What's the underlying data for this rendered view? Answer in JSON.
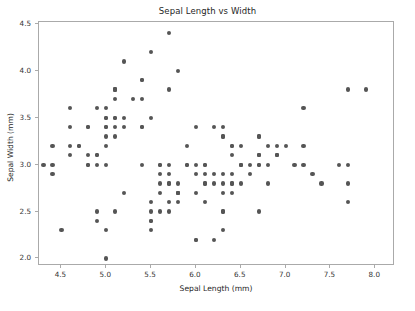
{
  "chart_data": {
    "type": "scatter",
    "title": "Sepal Length vs Width",
    "xlabel": "Sepal Length (mm)",
    "ylabel": "Sepal Width (mm)",
    "xlim": [
      4.25,
      8.22
    ],
    "ylim": [
      1.92,
      4.52
    ],
    "xticks": [
      4.5,
      5.0,
      5.5,
      6.0,
      6.5,
      7.0,
      7.5,
      8.0
    ],
    "xtick_labels": [
      "4.5",
      "5.0",
      "5.5",
      "6.0",
      "6.5",
      "7.0",
      "7.5",
      "8.0"
    ],
    "yticks": [
      2.0,
      2.5,
      3.0,
      3.5,
      4.0,
      4.5
    ],
    "ytick_labels": [
      "2.0",
      "2.5",
      "3.0",
      "3.5",
      "4.0",
      "4.5"
    ],
    "grid": false,
    "legend": null,
    "marker_color": "#555555",
    "marker_size_px": 4.2,
    "n_points": 150,
    "x": [
      5.1,
      4.9,
      4.7,
      4.6,
      5.0,
      5.4,
      4.6,
      5.0,
      4.4,
      4.9,
      5.4,
      4.8,
      4.8,
      4.3,
      5.8,
      5.7,
      5.4,
      5.1,
      5.7,
      5.1,
      5.4,
      5.1,
      4.6,
      5.1,
      4.8,
      5.0,
      5.0,
      5.2,
      5.2,
      4.7,
      4.8,
      5.4,
      5.2,
      5.5,
      4.9,
      5.0,
      5.5,
      4.9,
      4.4,
      5.1,
      5.0,
      4.5,
      4.4,
      5.0,
      5.1,
      4.8,
      5.1,
      4.6,
      5.3,
      5.0,
      7.0,
      6.4,
      6.9,
      5.5,
      6.5,
      5.7,
      6.3,
      4.9,
      6.6,
      5.2,
      5.0,
      5.9,
      6.0,
      6.1,
      5.6,
      6.7,
      5.6,
      5.8,
      6.2,
      5.6,
      5.9,
      6.1,
      6.3,
      6.1,
      6.4,
      6.6,
      6.8,
      6.7,
      6.0,
      5.7,
      5.5,
      5.5,
      5.8,
      6.0,
      5.4,
      6.0,
      6.7,
      6.3,
      5.6,
      5.5,
      5.5,
      6.1,
      5.8,
      5.0,
      5.6,
      5.7,
      5.7,
      6.2,
      5.1,
      5.7,
      6.3,
      5.8,
      7.1,
      6.3,
      6.5,
      7.6,
      4.9,
      7.3,
      6.7,
      7.2,
      6.5,
      6.4,
      6.8,
      5.7,
      5.8,
      6.4,
      6.5,
      7.7,
      7.7,
      6.0,
      6.9,
      5.6,
      7.7,
      6.3,
      6.7,
      7.2,
      6.2,
      6.1,
      6.4,
      7.2,
      7.4,
      7.9,
      6.4,
      6.3,
      6.1,
      7.7,
      6.3,
      6.4,
      6.0,
      6.9,
      6.7,
      6.9,
      5.8,
      6.8,
      6.7,
      6.7,
      6.3,
      6.5,
      6.2,
      5.9
    ],
    "y": [
      3.5,
      3.0,
      3.2,
      3.1,
      3.6,
      3.9,
      3.4,
      3.4,
      2.9,
      3.1,
      3.7,
      3.4,
      3.0,
      3.0,
      4.0,
      4.4,
      3.9,
      3.5,
      3.8,
      3.8,
      3.4,
      3.7,
      3.6,
      3.3,
      3.4,
      3.0,
      3.4,
      3.5,
      3.4,
      3.2,
      3.1,
      3.4,
      4.1,
      4.2,
      3.1,
      3.2,
      3.5,
      3.6,
      3.0,
      3.4,
      3.5,
      2.3,
      3.2,
      3.5,
      3.8,
      3.0,
      3.8,
      3.2,
      3.7,
      3.3,
      3.2,
      3.2,
      3.1,
      2.3,
      2.8,
      2.8,
      3.3,
      2.4,
      2.9,
      2.7,
      2.0,
      3.0,
      2.2,
      2.9,
      2.9,
      3.1,
      3.0,
      2.7,
      2.2,
      2.5,
      3.2,
      2.8,
      2.5,
      2.8,
      2.9,
      3.0,
      2.8,
      3.0,
      2.9,
      2.6,
      2.4,
      2.4,
      2.7,
      2.7,
      3.0,
      3.4,
      3.1,
      2.3,
      3.0,
      2.5,
      2.6,
      3.0,
      2.6,
      2.3,
      2.7,
      3.0,
      2.9,
      2.9,
      2.5,
      2.8,
      3.3,
      2.7,
      3.0,
      2.9,
      3.0,
      3.0,
      2.5,
      2.9,
      2.5,
      3.6,
      3.2,
      2.7,
      3.0,
      2.5,
      2.8,
      3.2,
      3.0,
      3.8,
      2.6,
      2.2,
      3.2,
      2.8,
      2.8,
      2.7,
      3.3,
      3.2,
      2.8,
      3.0,
      2.8,
      3.0,
      2.8,
      3.8,
      2.8,
      2.8,
      2.6,
      3.0,
      3.4,
      3.1,
      3.0,
      3.1,
      3.1,
      3.1,
      2.7,
      3.2,
      3.3,
      3.0,
      2.5,
      3.0,
      3.4,
      3.0
    ]
  }
}
